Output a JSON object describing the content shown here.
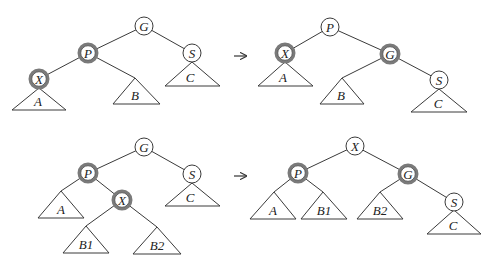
{
  "figure": {
    "colors": {
      "line": "#3a3a3a",
      "red_node_ring": "#7a7a7a",
      "background": "#ffffff"
    },
    "arrow_symbol": "→",
    "rows": [
      {
        "name": "single-rotation",
        "before": {
          "nodes": [
            {
              "id": "G",
              "label": "G",
              "x": 144,
              "y": 26,
              "red": false
            },
            {
              "id": "P",
              "label": "P",
              "x": 88,
              "y": 53,
              "red": true
            },
            {
              "id": "S",
              "label": "S",
              "x": 192,
              "y": 53,
              "red": false
            },
            {
              "id": "X",
              "label": "X",
              "x": 39,
              "y": 79,
              "red": true
            }
          ],
          "subtrees": [
            {
              "label": "A",
              "apex": [
                39,
                88
              ],
              "base": [
                12,
                66,
                110
              ]
            },
            {
              "label": "B",
              "apex": [
                135,
                78
              ],
              "base": [
                113,
                160,
                104
              ]
            },
            {
              "label": "C",
              "apex": [
                192,
                62
              ],
              "base": [
                165,
                220,
                86
              ]
            }
          ],
          "edges": [
            [
              "G",
              "P"
            ],
            [
              "G",
              "S"
            ],
            [
              "P",
              "X"
            ],
            [
              "P",
              "B"
            ]
          ]
        },
        "arrow": {
          "x1": 234,
          "x2": 247,
          "y": 56
        },
        "after": {
          "nodes": [
            {
              "id": "P",
              "label": "P",
              "x": 330,
              "y": 27,
              "red": false
            },
            {
              "id": "X",
              "label": "X",
              "x": 285,
              "y": 53,
              "red": true
            },
            {
              "id": "G",
              "label": "G",
              "x": 390,
              "y": 54,
              "red": true
            },
            {
              "id": "S",
              "label": "S",
              "x": 439,
              "y": 80,
              "red": false
            }
          ],
          "subtrees": [
            {
              "label": "A",
              "apex": [
                285,
                62
              ],
              "base": [
                258,
                313,
                86
              ]
            },
            {
              "label": "B",
              "apex": [
                342,
                78
              ],
              "base": [
                320,
                364,
                104
              ]
            },
            {
              "label": "C",
              "apex": [
                439,
                89
              ],
              "base": [
                411,
                467,
                112
              ]
            }
          ],
          "edges": [
            [
              "P",
              "X"
            ],
            [
              "P",
              "G"
            ],
            [
              "G",
              "B"
            ],
            [
              "G",
              "S"
            ]
          ]
        }
      },
      {
        "name": "double-rotation",
        "before": {
          "nodes": [
            {
              "id": "G",
              "label": "G",
              "x": 144,
              "y": 147,
              "red": false
            },
            {
              "id": "P",
              "label": "P",
              "x": 88,
              "y": 173,
              "red": true
            },
            {
              "id": "S",
              "label": "S",
              "x": 192,
              "y": 174,
              "red": false
            },
            {
              "id": "X",
              "label": "X",
              "x": 122,
              "y": 200,
              "red": true
            }
          ],
          "subtrees": [
            {
              "label": "A",
              "apex": [
                61,
                191
              ],
              "base": [
                38,
                84,
                218
              ]
            },
            {
              "label": "B1",
              "apex": [
                86,
                226
              ],
              "base": [
                63,
                109,
                253
              ]
            },
            {
              "label": "B2",
              "apex": [
                157,
                227
              ],
              "base": [
                133,
                181,
                254
              ]
            },
            {
              "label": "C",
              "apex": [
                192,
                183
              ],
              "base": [
                165,
                220,
                206
              ]
            }
          ],
          "edges": [
            [
              "G",
              "P"
            ],
            [
              "G",
              "S"
            ],
            [
              "P",
              "A"
            ],
            [
              "P",
              "X"
            ],
            [
              "X",
              "B1"
            ],
            [
              "X",
              "B2"
            ]
          ]
        },
        "arrow": {
          "x1": 234,
          "x2": 247,
          "y": 176
        },
        "after": {
          "nodes": [
            {
              "id": "X",
              "label": "X",
              "x": 355,
              "y": 146,
              "red": false
            },
            {
              "id": "P",
              "label": "P",
              "x": 298,
              "y": 173,
              "red": true
            },
            {
              "id": "G",
              "label": "G",
              "x": 408,
              "y": 174,
              "red": true
            },
            {
              "id": "S",
              "label": "S",
              "x": 454,
              "y": 202,
              "red": false
            }
          ],
          "subtrees": [
            {
              "label": "A",
              "apex": [
                274,
                192
              ],
              "base": [
                250,
                296,
                219
              ]
            },
            {
              "label": "B1",
              "apex": [
                323,
                192
              ],
              "base": [
                301,
                347,
                219
              ]
            },
            {
              "label": "B2",
              "apex": [
                380,
                192
              ],
              "base": [
                357,
                403,
                219
              ]
            },
            {
              "label": "C",
              "apex": [
                454,
                210
              ],
              "base": [
                427,
                481,
                234
              ]
            }
          ],
          "edges": [
            [
              "X",
              "P"
            ],
            [
              "X",
              "G"
            ],
            [
              "P",
              "A"
            ],
            [
              "P",
              "B1"
            ],
            [
              "G",
              "B2"
            ],
            [
              "G",
              "S"
            ]
          ]
        }
      }
    ]
  },
  "labels": {
    "r1b_G": "G",
    "r1b_P": "P",
    "r1b_S": "S",
    "r1b_X": "X",
    "r1b_A": "A",
    "r1b_B": "B",
    "r1b_C": "C",
    "r1a_P": "P",
    "r1a_X": "X",
    "r1a_G": "G",
    "r1a_S": "S",
    "r1a_A": "A",
    "r1a_B": "B",
    "r1a_C": "C",
    "r2b_G": "G",
    "r2b_P": "P",
    "r2b_S": "S",
    "r2b_X": "X",
    "r2b_A": "A",
    "r2b_B1": "B1",
    "r2b_B2": "B2",
    "r2b_C": "C",
    "r2a_X": "X",
    "r2a_P": "P",
    "r2a_G": "G",
    "r2a_S": "S",
    "r2a_A": "A",
    "r2a_B1": "B1",
    "r2a_B2": "B2",
    "r2a_C": "C"
  }
}
